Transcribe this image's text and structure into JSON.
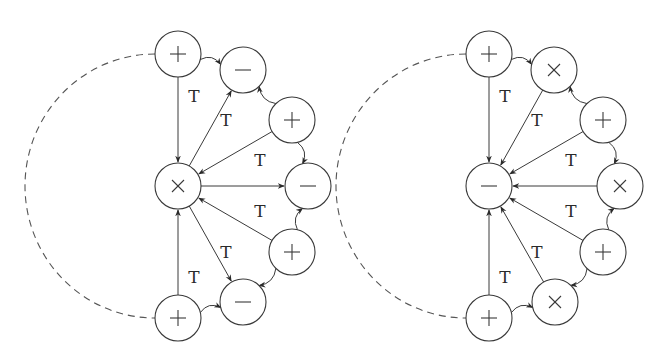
{
  "figure": {
    "colors": {
      "stroke": "#3a3a3a",
      "background": "#ffffff"
    },
    "edge_label": "T",
    "diagrams": [
      {
        "id": "left",
        "center": {
          "symbol": "×",
          "x": 178,
          "y": 186
        },
        "outer_nodes": [
          {
            "symbol": "+",
            "x": 178,
            "y": 54
          },
          {
            "symbol": "−",
            "x": 243,
            "y": 70
          },
          {
            "symbol": "+",
            "x": 292,
            "y": 120
          },
          {
            "symbol": "−",
            "x": 308,
            "y": 186
          },
          {
            "symbol": "+",
            "x": 292,
            "y": 252
          },
          {
            "symbol": "−",
            "x": 243,
            "y": 302
          },
          {
            "symbol": "+",
            "x": 178,
            "y": 318
          }
        ],
        "labels": [
          {
            "text": "T",
            "x": 194,
            "y": 102
          },
          {
            "text": "T",
            "x": 226,
            "y": 126
          },
          {
            "text": "T",
            "x": 260,
            "y": 166
          },
          {
            "text": "T",
            "x": 260,
            "y": 217
          },
          {
            "text": "T",
            "x": 226,
            "y": 258
          },
          {
            "text": "T",
            "x": 194,
            "y": 283
          }
        ]
      },
      {
        "id": "right",
        "center": {
          "symbol": "−",
          "x": 489,
          "y": 186
        },
        "outer_nodes": [
          {
            "symbol": "+",
            "x": 489,
            "y": 54
          },
          {
            "symbol": "×",
            "x": 554,
            "y": 70
          },
          {
            "symbol": "+",
            "x": 603,
            "y": 120
          },
          {
            "symbol": "×",
            "x": 620,
            "y": 186
          },
          {
            "symbol": "+",
            "x": 603,
            "y": 252
          },
          {
            "symbol": "×",
            "x": 555,
            "y": 302
          },
          {
            "symbol": "+",
            "x": 489,
            "y": 318
          }
        ],
        "labels": [
          {
            "text": "T",
            "x": 505,
            "y": 102
          },
          {
            "text": "T",
            "x": 537,
            "y": 126
          },
          {
            "text": "T",
            "x": 571,
            "y": 166
          },
          {
            "text": "T",
            "x": 571,
            "y": 217
          },
          {
            "text": "T",
            "x": 537,
            "y": 258
          },
          {
            "text": "T",
            "x": 505,
            "y": 283
          }
        ]
      }
    ]
  }
}
